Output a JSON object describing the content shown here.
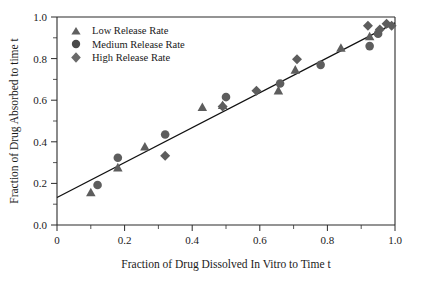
{
  "chart_data": {
    "type": "scatter",
    "title": "",
    "xlabel": "Fraction of Drug Dissolved In Vitro to Time t",
    "ylabel": "Fraction of Drug Absorbed to time t",
    "xlim": [
      0,
      1.0
    ],
    "ylim": [
      0.0,
      1.0
    ],
    "xticks": [
      0,
      0.2,
      0.4,
      0.6,
      0.8,
      1.0
    ],
    "xticklabels": [
      "0",
      "0.2",
      "0.4",
      "0.6",
      "0.8",
      "1.0"
    ],
    "yticks": [
      0.0,
      0.2,
      0.4,
      0.6,
      0.8,
      1.0
    ],
    "yticklabels": [
      "0.0",
      "0.2",
      "0.4",
      "0.6",
      "0.8",
      "1.0"
    ],
    "grid": false,
    "minor_ticks": true,
    "legend_position": "upper-left",
    "series": [
      {
        "name": "Low Release Rate",
        "marker": "triangle",
        "color": "#606060",
        "points": [
          [
            0.1,
            0.155
          ],
          [
            0.18,
            0.275
          ],
          [
            0.26,
            0.375
          ],
          [
            0.43,
            0.565
          ],
          [
            0.49,
            0.575
          ],
          [
            0.655,
            0.645
          ],
          [
            0.705,
            0.745
          ],
          [
            0.84,
            0.85
          ],
          [
            0.925,
            0.905
          ]
        ]
      },
      {
        "name": "Medium Release Rate",
        "marker": "circle",
        "color": "#4a4a4a",
        "points": [
          [
            0.12,
            0.192
          ],
          [
            0.18,
            0.323
          ],
          [
            0.32,
            0.435
          ],
          [
            0.5,
            0.615
          ],
          [
            0.66,
            0.68
          ],
          [
            0.78,
            0.77
          ],
          [
            0.925,
            0.86
          ],
          [
            0.95,
            0.92
          ]
        ]
      },
      {
        "name": "High Release Rate",
        "marker": "diamond",
        "color": "#6a6a6a",
        "points": [
          [
            0.32,
            0.333
          ],
          [
            0.49,
            0.57
          ],
          [
            0.59,
            0.645
          ],
          [
            0.71,
            0.797
          ],
          [
            0.92,
            0.958
          ],
          [
            0.955,
            0.94
          ],
          [
            0.975,
            0.968
          ],
          [
            0.99,
            0.958
          ]
        ]
      }
    ],
    "fit_line": {
      "name": "regression line",
      "x_start": 0.0,
      "y_start": 0.132,
      "x_end": 1.0,
      "y_end": 0.972
    }
  },
  "legend": {
    "items": [
      {
        "label": "Low Release Rate",
        "marker": "triangle-marker"
      },
      {
        "label": "Medium Release Rate",
        "marker": "circle-marker"
      },
      {
        "label": "High Release Rate",
        "marker": "diamond-marker"
      }
    ]
  }
}
